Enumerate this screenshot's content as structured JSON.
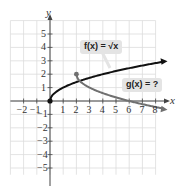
{
  "chart_data": {
    "type": "line",
    "title": "",
    "xlabel": "x",
    "ylabel": "y",
    "xlim": [
      -2.5,
      8.5
    ],
    "ylim": [
      -5.5,
      6
    ],
    "grid": true,
    "x_ticks": [
      "−2",
      "−1",
      "1",
      "2",
      "3",
      "4",
      "5",
      "6",
      "7",
      "8"
    ],
    "y_ticks": [
      "5",
      "4",
      "3",
      "2",
      "1",
      "−1",
      "−2",
      "−3",
      "−4",
      "−5"
    ],
    "series": [
      {
        "name": "f(x) = √x",
        "color": "#111111",
        "start_point": [
          0,
          0
        ],
        "x": [
          0,
          0.25,
          1,
          2,
          3,
          4,
          5,
          6,
          7,
          8,
          8.5
        ],
        "y": [
          0,
          0.5,
          1,
          1.41,
          1.73,
          2,
          2.24,
          2.45,
          2.65,
          2.83,
          2.92
        ]
      },
      {
        "name": "g(x) = ?",
        "color": "#707070",
        "start_point": [
          2,
          2
        ],
        "x": [
          2,
          2.25,
          3,
          4,
          5,
          6,
          7,
          8,
          8.6
        ],
        "y": [
          2,
          1.5,
          1,
          0.59,
          0.27,
          0,
          -0.24,
          -0.45,
          -0.57
        ]
      }
    ],
    "annotations": [
      {
        "text": "f(x) = √x",
        "target": "f"
      },
      {
        "text": "g(x) = ?",
        "target": "g"
      }
    ]
  },
  "labels": {
    "x_axis": "x",
    "y_axis": "y",
    "f_callout": "f(x) = √x",
    "g_callout": "g(x) = ?",
    "x_ticks": [
      {
        "v": -2,
        "t": "−2"
      },
      {
        "v": -1,
        "t": "−1"
      },
      {
        "v": 1,
        "t": "1"
      },
      {
        "v": 2,
        "t": "2"
      },
      {
        "v": 3,
        "t": "3"
      },
      {
        "v": 4,
        "t": "4"
      },
      {
        "v": 5,
        "t": "5"
      },
      {
        "v": 6,
        "t": "6"
      },
      {
        "v": 7,
        "t": "7"
      },
      {
        "v": 8,
        "t": "8"
      }
    ],
    "y_ticks": [
      {
        "v": 5,
        "t": "5"
      },
      {
        "v": 4,
        "t": "4"
      },
      {
        "v": 3,
        "t": "3"
      },
      {
        "v": 2,
        "t": "2"
      },
      {
        "v": 1,
        "t": "1"
      },
      {
        "v": -1,
        "t": "−1"
      },
      {
        "v": -2,
        "t": "−2"
      },
      {
        "v": -3,
        "t": "−3"
      },
      {
        "v": -4,
        "t": "−4"
      },
      {
        "v": -5,
        "t": "−5"
      }
    ]
  }
}
